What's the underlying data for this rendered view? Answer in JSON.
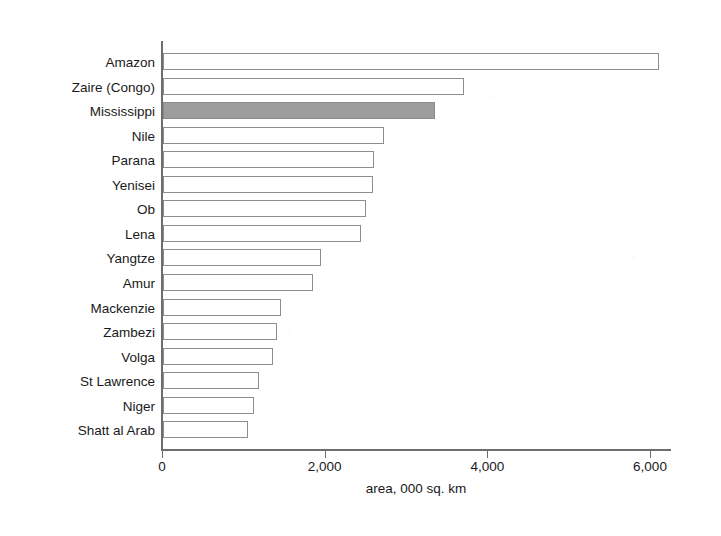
{
  "chart_data": {
    "type": "bar",
    "orientation": "horizontal",
    "title": "",
    "subtitle": "",
    "xlabel": "area, 000 sq. km",
    "ylabel": "",
    "xlim": [
      0,
      6300
    ],
    "xticks": [
      0,
      2000,
      4000,
      6000
    ],
    "xtick_labels": [
      "0",
      "2,000",
      "4,000",
      "6,000"
    ],
    "grid": false,
    "legend": false,
    "legend_position": "none",
    "categories": [
      "Amazon",
      "Zaire (Congo)",
      "Mississippi",
      "Nile",
      "Parana",
      "Yenisei",
      "Ob",
      "Lena",
      "Yangtze",
      "Amur",
      "Mackenzie",
      "Zambezi",
      "Volga",
      "St Lawrence",
      "Niger",
      "Shatt al Arab"
    ],
    "values": [
      6100,
      3700,
      3350,
      2720,
      2600,
      2580,
      2500,
      2430,
      1940,
      1850,
      1450,
      1400,
      1350,
      1180,
      1120,
      1050
    ],
    "highlighted_category": "Mississippi",
    "bar_colors": {
      "default_fill": "#ffffff",
      "default_stroke": "#8d8d8d",
      "highlight_fill": "#9d9d9d",
      "highlight_stroke": "#8a8a8a"
    },
    "axis_color": "#6d6d6d",
    "text_color": "#1a1a1a",
    "background": "#ffffff"
  }
}
